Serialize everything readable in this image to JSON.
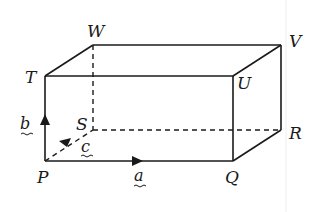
{
  "diagram": {
    "vertices": {
      "T": {
        "label": "T",
        "x": 45,
        "y": 76
      },
      "U": {
        "label": "U",
        "x": 233,
        "y": 76
      },
      "V": {
        "label": "V",
        "x": 281,
        "y": 45
      },
      "W": {
        "label": "W",
        "x": 93,
        "y": 45
      },
      "P": {
        "label": "P",
        "x": 45,
        "y": 161
      },
      "Q": {
        "label": "Q",
        "x": 233,
        "y": 161
      },
      "R": {
        "label": "R",
        "x": 281,
        "y": 130
      },
      "S": {
        "label": "S",
        "x": 93,
        "y": 130
      }
    },
    "vectors": {
      "a": {
        "label": "a",
        "from": "P",
        "to": "Q",
        "direction": "right"
      },
      "b": {
        "label": "b",
        "from": "P",
        "to": "T",
        "direction": "up"
      },
      "c": {
        "label": "c",
        "from": "S",
        "to": "P",
        "direction": "toward-P"
      }
    },
    "edges_solid": [
      "TU",
      "UV",
      "VW",
      "WT",
      "PQ",
      "QU",
      "TP",
      "QR",
      "RV"
    ],
    "edges_hidden": [
      "SW",
      "SR",
      "SP"
    ]
  }
}
